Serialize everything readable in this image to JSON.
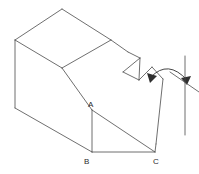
{
  "figure": {
    "stroke_color": "#4a4a4a",
    "label_color": "#2b2b2b",
    "background_color": "#ffffff",
    "stroke_width": 0.8,
    "width": 199,
    "height": 174
  },
  "vertex_labels": [
    {
      "id": "A",
      "text": "A",
      "x": 88,
      "y": 101
    },
    {
      "id": "B",
      "text": "B",
      "x": 84,
      "y": 158
    },
    {
      "id": "C",
      "text": "C",
      "x": 153,
      "y": 158
    }
  ],
  "geometry": {
    "top_face": "15,40 62,9 111,40 62,68",
    "left_face": "15,40 15,108 62,139 62,68",
    "front_slant_face": "62,68 111,40 128,52 95,104 62,139",
    "lower_triangle": "92,110 92,152 155,152",
    "base_edges": [
      "15,108 92,152",
      "92,152 155,152"
    ],
    "right_slant_face": "128,52 140,58 123,72 139,80 153,68 163,78 155,143",
    "edges": [
      {
        "name": "top-left-ridge",
        "d": "M 15,40 L 62,9"
      },
      {
        "name": "top-right-ridge",
        "d": "M 62,9 L 111,40"
      },
      {
        "name": "top-front-left",
        "d": "M 15,40 L 62,68"
      },
      {
        "name": "top-front-right",
        "d": "M 62,68 L 111,40"
      },
      {
        "name": "left-vertical",
        "d": "M 15,40 L 15,108"
      },
      {
        "name": "left-bottom",
        "d": "M 15,108 L 92,152"
      },
      {
        "name": "slant-ridge-down",
        "d": "M 62,68 L 92,110"
      },
      {
        "name": "slant-to-C",
        "d": "M 92,110 L 155,152"
      },
      {
        "name": "A-vertical",
        "d": "M 92,110 L 92,152"
      },
      {
        "name": "B-to-C",
        "d": "M 92,152 L 155,152"
      },
      {
        "name": "upper-right-edge",
        "d": "M 111,40 L 128,52"
      },
      {
        "name": "notch-left",
        "d": "M 128,52 L 140,58"
      },
      {
        "name": "notch-down",
        "d": "M 140,58 L 123,72"
      },
      {
        "name": "notch-up",
        "d": "M 123,72 L 139,80"
      },
      {
        "name": "notch-cross",
        "d": "M 140,58 L 139,80"
      },
      {
        "name": "notch-right",
        "d": "M 139,80 L 152,67"
      },
      {
        "name": "right-face-edge",
        "d": "M 152,67 L 163,79"
      },
      {
        "name": "right-face-down",
        "d": "M 163,79 L 156,144"
      },
      {
        "name": "right-face-bottom",
        "d": "M 156,144 L 155,152"
      }
    ]
  },
  "annotation": {
    "arc": {
      "name": "rotation-arc",
      "path": "M 151,77 Q 168,60 186,80",
      "arrow_start": "148,74 157,77 151,82",
      "arrow_end": "189,77 180,78 186,84"
    },
    "axis_line": {
      "name": "reference-axis",
      "d": "M 185,56 L 185,135"
    },
    "tail_line": {
      "name": "extension-line",
      "d": "M 170,72 L 199,92"
    }
  }
}
